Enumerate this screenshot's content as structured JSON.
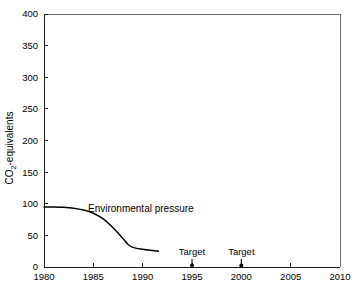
{
  "chart_data": {
    "type": "line",
    "title": "",
    "xlabel": "",
    "ylabel": "CO2-equivalents",
    "ylabel_parts": {
      "pre": "CO",
      "sub": "2",
      "post": "-equivalents"
    },
    "xlim": [
      1980,
      2010
    ],
    "ylim": [
      0,
      400
    ],
    "grid": false,
    "legend_position": "inline-annotation",
    "x_ticks": [
      1980,
      1985,
      1990,
      1995,
      2000,
      2005,
      2010
    ],
    "x_tick_labels": [
      "1980",
      "1985",
      "1990",
      "1995",
      "2000",
      "2005",
      "2010"
    ],
    "y_ticks": [
      0,
      50,
      100,
      150,
      200,
      250,
      300,
      350,
      400
    ],
    "y_tick_labels": [
      "0",
      "50",
      "100",
      "150",
      "200",
      "250",
      "300",
      "350",
      "400"
    ],
    "series": [
      {
        "name": "Environmental pressure",
        "label": "Environmental pressure",
        "color": "#000000",
        "x": [
          1980,
          1981,
          1982,
          1983,
          1984,
          1985,
          1986,
          1987,
          1988,
          1988.5,
          1989,
          1990,
          1991,
          1991.6
        ],
        "values": [
          95,
          95,
          94.5,
          93,
          90,
          85,
          76,
          62,
          45,
          36,
          31,
          28,
          26,
          25
        ]
      }
    ],
    "annotations": [
      {
        "label": "Target",
        "x": 1995,
        "y": 0,
        "marker": "dot-with-stem"
      },
      {
        "label": "Target",
        "x": 2000,
        "y": 0,
        "marker": "dot-with-stem"
      }
    ]
  }
}
